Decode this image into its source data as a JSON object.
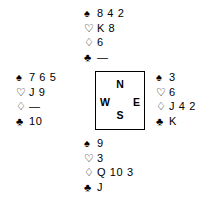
{
  "diagram": {
    "type": "bridge-deal",
    "suit_symbols": {
      "spade": "♠",
      "heart": "♡",
      "diamond": "♢",
      "club": "♣"
    },
    "void_mark": "—",
    "colors": {
      "ink": "#000000",
      "background": "#ffffff",
      "border": "#000000"
    }
  },
  "compass": {
    "north": "N",
    "south": "S",
    "west": "W",
    "east": "E"
  },
  "hands": {
    "north": {
      "label": "North",
      "spades": "8 4 2",
      "hearts": "K 8",
      "diamonds": "6",
      "clubs": "—"
    },
    "west": {
      "label": "West",
      "spades": "7 6 5",
      "hearts": "J 9",
      "diamonds": "—",
      "clubs": "10"
    },
    "east": {
      "label": "East",
      "spades": "3",
      "hearts": "6",
      "diamonds": "J 4 2",
      "clubs": "K"
    },
    "south": {
      "label": "South",
      "spades": "9",
      "hearts": "3",
      "diamonds": "Q 10 3",
      "clubs": "J"
    }
  }
}
